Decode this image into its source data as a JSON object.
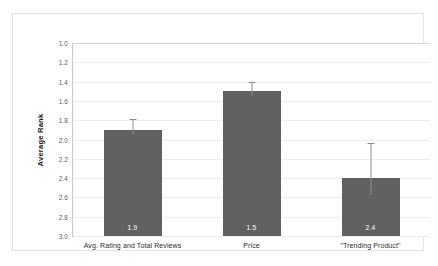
{
  "chart_data": {
    "type": "bar",
    "title": "",
    "subtitle": "",
    "xlabel": "",
    "ylabel": "Average Rank",
    "categories": [
      "Avg. Rating and Total Reviews",
      "Price",
      "\"Trending Product\""
    ],
    "values": [
      1.9,
      1.5,
      2.4
    ],
    "value_labels": [
      "1.9",
      "1.5",
      "2.4"
    ],
    "errors": [
      {
        "low": 1.95,
        "high": 1.79
      },
      {
        "low": 1.55,
        "high": 1.4
      },
      {
        "low": 2.57,
        "high": 2.04
      }
    ],
    "ylim": [
      1.0,
      3.0
    ],
    "y_inverted": true,
    "ytick_labels": [
      "1.0",
      "1.2",
      "1.4",
      "1.6",
      "1.8",
      "2.0",
      "2.2",
      "2.4",
      "2.6",
      "2.8",
      "3.0"
    ],
    "ytick_values": [
      1.0,
      1.2,
      1.4,
      1.6,
      1.8,
      2.0,
      2.2,
      2.4,
      2.6,
      2.8,
      3.0
    ],
    "grid": true,
    "legend": null,
    "legend_position": "none",
    "colors": {
      "bar_fill": "#616161",
      "value_label": "#ffffff",
      "gridline": "#ededed",
      "axis_line": "#9a9a9a",
      "frame": "#e3e3e3",
      "background": "#ffffff",
      "errorbar": "#8d8d8d"
    }
  }
}
